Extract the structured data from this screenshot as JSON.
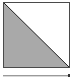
{
  "swatch": {
    "shape": "split-diagonal",
    "fill_color": "#a9a9a9",
    "background_color": "#ffffff",
    "border_color": "#4a4a4a",
    "diagonal_color": "#222222"
  },
  "bar": {
    "track_color": "#d8d8d8",
    "end_marker_color": "#333333"
  }
}
